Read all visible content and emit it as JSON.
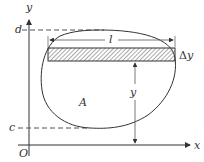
{
  "diagram": {
    "type": "area-integration-strip",
    "labels": {
      "y_axis": "y",
      "x_axis": "x",
      "origin": "O",
      "top_bound": "d",
      "bottom_bound": "c",
      "strip_length": "l",
      "strip_height_delta": "Δ",
      "strip_height_var": "y",
      "strip_distance": "y",
      "region": "A"
    },
    "colors": {
      "line": "#333333",
      "dashed": "#555555",
      "hatch": "#444444",
      "background": "#ffffff"
    }
  }
}
